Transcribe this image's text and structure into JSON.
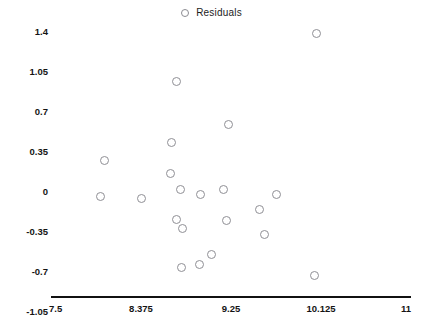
{
  "chart_data": {
    "type": "scatter",
    "title": "",
    "xlabel": "",
    "ylabel": "",
    "legend": [
      {
        "name": "Residuals",
        "marker": "open-circle",
        "color": "#8f8f95"
      }
    ],
    "legend_position": "top-center",
    "grid": false,
    "xlim": [
      7.5,
      11
    ],
    "ylim": [
      -1.05,
      1.4
    ],
    "xticks": [
      "7.5",
      "8.375",
      "9.25",
      "10.125",
      "11"
    ],
    "xtick_values": [
      7.5,
      8.375,
      9.25,
      10.125,
      11
    ],
    "yticks": [
      "1.4",
      "1.05",
      "0.7",
      "0.35",
      "0",
      "-0.35",
      "-0.7",
      "-1.05"
    ],
    "ytick_values": [
      1.4,
      1.05,
      0.7,
      0.35,
      0,
      -0.35,
      -0.7,
      -1.05
    ],
    "series": [
      {
        "name": "Residuals",
        "points": [
          {
            "x": 8.02,
            "y": 0.28
          },
          {
            "x": 7.98,
            "y": -0.04
          },
          {
            "x": 8.38,
            "y": -0.06
          },
          {
            "x": 8.72,
            "y": 0.97
          },
          {
            "x": 8.67,
            "y": 0.43
          },
          {
            "x": 8.66,
            "y": 0.16
          },
          {
            "x": 8.76,
            "y": 0.02
          },
          {
            "x": 8.72,
            "y": -0.24
          },
          {
            "x": 8.78,
            "y": -0.32
          },
          {
            "x": 8.77,
            "y": -0.66
          },
          {
            "x": 8.95,
            "y": -0.02
          },
          {
            "x": 8.94,
            "y": -0.63
          },
          {
            "x": 9.06,
            "y": -0.55
          },
          {
            "x": 9.23,
            "y": 0.59
          },
          {
            "x": 9.18,
            "y": 0.02
          },
          {
            "x": 9.21,
            "y": -0.25
          },
          {
            "x": 9.53,
            "y": -0.15
          },
          {
            "x": 9.58,
            "y": -0.37
          },
          {
            "x": 9.69,
            "y": -0.02
          },
          {
            "x": 10.06,
            "y": -0.73
          },
          {
            "x": 10.08,
            "y": 1.39
          }
        ]
      }
    ]
  },
  "legend": {
    "label": "Residuals"
  },
  "axes": {
    "x_left_px": 51,
    "x_right_px": 411,
    "y_zero_px": 192,
    "y_px_per_unit": 114.2857
  }
}
